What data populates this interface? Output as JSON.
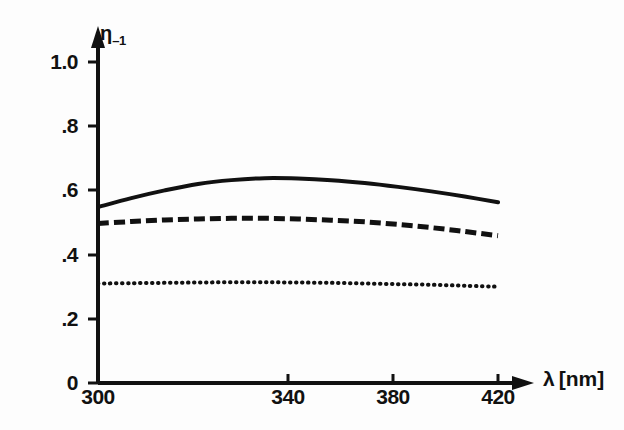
{
  "figure": {
    "background_color": "#fdfdfd",
    "ink_color": "#111111"
  },
  "axes": {
    "y_title_symbol": "η",
    "y_title_subscript": "–1",
    "x_title": "λ [nm]",
    "x_title_symbol": "λ",
    "x_title_unit": "[nm]",
    "y_ticks": [
      "1.0",
      ".8",
      ".6",
      ".4",
      ".2",
      "0"
    ],
    "x_ticks": [
      "300",
      "340",
      "380",
      "420"
    ]
  },
  "chart_data": {
    "type": "line",
    "title": "",
    "subtitle": "",
    "xlabel": "λ [nm]",
    "ylabel": "η₋₁",
    "xlim": [
      300,
      420
    ],
    "ylim": [
      0,
      1.0
    ],
    "ytick_values": [
      1.0,
      0.8,
      0.6,
      0.4,
      0.2,
      0
    ],
    "xtick_values": [
      300,
      340,
      380,
      420
    ],
    "grid": false,
    "legend": "none",
    "x": [
      300,
      310,
      320,
      330,
      340,
      350,
      360,
      370,
      380,
      390,
      400,
      410,
      420
    ],
    "series": [
      {
        "name": "solid-curve",
        "style": "solid",
        "color": "#111111",
        "values": [
          0.548,
          0.576,
          0.6,
          0.62,
          0.632,
          0.638,
          0.637,
          0.632,
          0.623,
          0.611,
          0.597,
          0.581,
          0.563
        ]
      },
      {
        "name": "dashed-curve",
        "style": "dashed",
        "color": "#111111",
        "values": [
          0.497,
          0.503,
          0.508,
          0.511,
          0.513,
          0.513,
          0.511,
          0.507,
          0.502,
          0.494,
          0.484,
          0.472,
          0.459
        ]
      },
      {
        "name": "dotted-curve",
        "style": "dotted",
        "color": "#111111",
        "values": [
          0.31,
          0.311,
          0.312,
          0.313,
          0.314,
          0.314,
          0.313,
          0.312,
          0.31,
          0.308,
          0.306,
          0.303,
          0.3
        ]
      }
    ]
  }
}
